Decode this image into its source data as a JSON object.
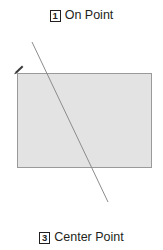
{
  "figure": {
    "background_color": "#ffffff",
    "width": 163,
    "height": 250
  },
  "captions": {
    "top": {
      "number": "1",
      "label": "On Point"
    },
    "bottom": {
      "number": "3",
      "label": "Center Point"
    }
  },
  "shapes": {
    "rectangle": {
      "name": "rectangle",
      "fill_color": "#e3e3e3",
      "stroke_color": "#9a9a9a",
      "x": 17,
      "y": 73,
      "width": 135,
      "height": 95
    },
    "diagonal_line": {
      "name": "diagonal-line",
      "stroke_color": "#8c8c8c",
      "x1": 32,
      "y1": 42,
      "x2": 108,
      "y2": 202
    },
    "cursor": {
      "name": "pen-cursor",
      "color": "#3a3a3a",
      "x": 17,
      "y": 66
    }
  }
}
